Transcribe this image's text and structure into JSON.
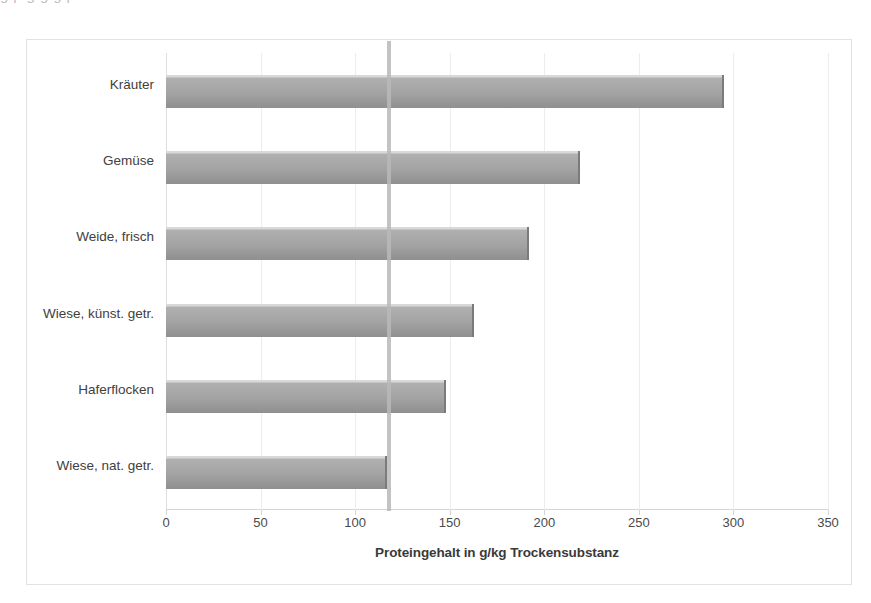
{
  "page": {
    "clipped_top_text": "g                p    g                                                              g  g  p"
  },
  "chart_data": {
    "type": "bar",
    "orientation": "horizontal",
    "title": "",
    "xlabel": "Proteingehalt in g/kg Trockensubstanz",
    "ylabel": "",
    "xlim": [
      0,
      350
    ],
    "xticks": [
      0,
      50,
      100,
      150,
      200,
      250,
      300,
      350
    ],
    "xtick_labels": [
      "0",
      "50",
      "100",
      "150",
      "200",
      "250",
      "300",
      "350"
    ],
    "grid": true,
    "legend": "none",
    "bar_color": "#a3a3a3",
    "categories": [
      "Kräuter",
      "Gemüse",
      "Weide, frisch",
      "Wiese, künst. getr.",
      "Haferflocken",
      "Wiese, nat. getr."
    ],
    "values": [
      295,
      219,
      192,
      163,
      148,
      117
    ],
    "reference_line": {
      "name": "requirement-line",
      "value": 118,
      "color": "#b9b9b9"
    }
  }
}
